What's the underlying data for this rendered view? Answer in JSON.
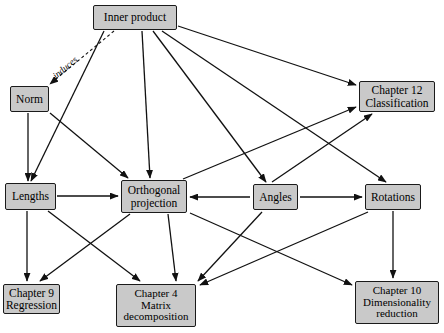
{
  "diagram": {
    "canvas": {
      "width": 444,
      "height": 333
    },
    "style": {
      "node_fill": "#c9c9c9",
      "node_stroke": "#1a1a1a",
      "edge_color": "#111111",
      "background": "#ffffff"
    },
    "nodes": [
      {
        "id": "inner_product",
        "label": "Inner product",
        "x": 93,
        "y": 5,
        "w": 84,
        "h": 25,
        "lines": 1
      },
      {
        "id": "norm",
        "label": "Norm",
        "x": 10,
        "y": 86,
        "w": 39,
        "h": 26,
        "lines": 1
      },
      {
        "id": "chapter12",
        "label": "Chapter 12\nClassification",
        "x": 359,
        "y": 81,
        "w": 76,
        "h": 31,
        "lines": 2
      },
      {
        "id": "lengths",
        "label": "Lengths",
        "x": 5,
        "y": 183,
        "w": 51,
        "h": 27,
        "lines": 1
      },
      {
        "id": "orthogonal_projection",
        "label": "Orthogonal\nprojection",
        "x": 121,
        "y": 180,
        "w": 66,
        "h": 33,
        "lines": 2
      },
      {
        "id": "angles",
        "label": "Angles",
        "x": 253,
        "y": 184,
        "w": 45,
        "h": 26,
        "lines": 1
      },
      {
        "id": "rotations",
        "label": "Rotations",
        "x": 365,
        "y": 184,
        "w": 56,
        "h": 26,
        "lines": 1
      },
      {
        "id": "chapter9",
        "label": "Chapter 9\nRegression",
        "x": 3,
        "y": 284,
        "w": 57,
        "h": 30,
        "lines": 2
      },
      {
        "id": "chapter4",
        "label": "Chapter 4\nMatrix\ndecomposition",
        "x": 116,
        "y": 284,
        "w": 80,
        "h": 43,
        "lines": 3
      },
      {
        "id": "chapter10",
        "label": "Chapter 10\nDimensionality\nreduction",
        "x": 355,
        "y": 281,
        "w": 84,
        "h": 43,
        "lines": 3
      }
    ],
    "edges": [
      {
        "id": "e-inner-norm",
        "from": "inner_product",
        "to": "norm",
        "label": "induces",
        "dashed": true,
        "x1": 114,
        "y1": 31,
        "x2": 50,
        "y2": 84
      },
      {
        "id": "e-inner-lengths",
        "from": "inner_product",
        "to": "lengths",
        "dashed": false,
        "x1": 104,
        "y1": 31,
        "x2": 31,
        "y2": 181
      },
      {
        "id": "e-inner-orthproj",
        "from": "inner_product",
        "to": "orthogonal_projection",
        "dashed": false,
        "x1": 142,
        "y1": 31,
        "x2": 150,
        "y2": 178
      },
      {
        "id": "e-inner-angles",
        "from": "inner_product",
        "to": "angles",
        "dashed": false,
        "x1": 153,
        "y1": 31,
        "x2": 266,
        "y2": 182
      },
      {
        "id": "e-inner-rotations",
        "from": "inner_product",
        "to": "rotations",
        "dashed": false,
        "x1": 162,
        "y1": 31,
        "x2": 386,
        "y2": 182
      },
      {
        "id": "e-inner-chapter12",
        "from": "inner_product",
        "to": "chapter12",
        "dashed": false,
        "x1": 178,
        "y1": 26,
        "x2": 356,
        "y2": 85
      },
      {
        "id": "e-norm-lengths",
        "from": "norm",
        "to": "lengths",
        "dashed": false,
        "x1": 28,
        "y1": 113,
        "x2": 28,
        "y2": 181
      },
      {
        "id": "e-norm-orthproj",
        "from": "norm",
        "to": "orthogonal_projection",
        "dashed": false,
        "x1": 50,
        "y1": 113,
        "x2": 128,
        "y2": 178
      },
      {
        "id": "e-lengths-orthproj",
        "from": "lengths",
        "to": "orthogonal_projection",
        "dashed": false,
        "x1": 57,
        "y1": 196,
        "x2": 118,
        "y2": 196
      },
      {
        "id": "e-lengths-chapter9",
        "from": "lengths",
        "to": "chapter9",
        "dashed": false,
        "x1": 27,
        "y1": 211,
        "x2": 27,
        "y2": 281
      },
      {
        "id": "e-lengths-chapter4",
        "from": "lengths",
        "to": "chapter4",
        "dashed": false,
        "x1": 48,
        "y1": 211,
        "x2": 140,
        "y2": 281
      },
      {
        "id": "e-orthproj-chapter9",
        "from": "orthogonal_projection",
        "to": "chapter9",
        "dashed": false,
        "x1": 130,
        "y1": 214,
        "x2": 40,
        "y2": 281
      },
      {
        "id": "e-orthproj-chapter4",
        "from": "orthogonal_projection",
        "to": "chapter4",
        "dashed": false,
        "x1": 168,
        "y1": 214,
        "x2": 176,
        "y2": 281
      },
      {
        "id": "e-orthproj-chapter12",
        "from": "orthogonal_projection",
        "to": "chapter12",
        "dashed": false,
        "x1": 183,
        "y1": 179,
        "x2": 356,
        "y2": 107
      },
      {
        "id": "e-angles-orthproj",
        "from": "angles",
        "to": "orthogonal_projection",
        "dashed": false,
        "x1": 250,
        "y1": 197,
        "x2": 190,
        "y2": 197
      },
      {
        "id": "e-angles-rotations",
        "from": "angles",
        "to": "rotations",
        "dashed": false,
        "x1": 300,
        "y1": 197,
        "x2": 362,
        "y2": 197
      },
      {
        "id": "e-angles-chapter12",
        "from": "angles",
        "to": "chapter12",
        "dashed": false,
        "x1": 272,
        "y1": 182,
        "x2": 372,
        "y2": 114
      },
      {
        "id": "e-angles-chapter4",
        "from": "angles",
        "to": "chapter4",
        "dashed": false,
        "x1": 262,
        "y1": 212,
        "x2": 198,
        "y2": 281
      },
      {
        "id": "e-rotations-chapter10",
        "from": "rotations",
        "to": "chapter10",
        "dashed": false,
        "x1": 393,
        "y1": 211,
        "x2": 393,
        "y2": 278
      },
      {
        "id": "e-rotations-chapter4",
        "from": "rotations",
        "to": "chapter4",
        "dashed": false,
        "x1": 368,
        "y1": 212,
        "x2": 200,
        "y2": 285
      },
      {
        "id": "e-orthproj-chapter10",
        "from": "orthogonal_projection",
        "to": "chapter10",
        "dashed": false,
        "x1": 190,
        "y1": 213,
        "x2": 352,
        "y2": 285
      }
    ],
    "edge_labels": [
      {
        "id": "induces-label",
        "text": "induces",
        "x": 54,
        "y": 72,
        "rotate": -40
      }
    ]
  }
}
